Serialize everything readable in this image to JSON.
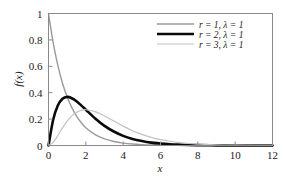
{
  "chart_data": {
    "type": "line",
    "title": "",
    "xlabel": "x",
    "ylabel": "f(x)",
    "xlim": [
      0,
      12
    ],
    "ylim": [
      0,
      1
    ],
    "grid": false,
    "legend_position": "upper-right-inset",
    "xticks": [
      "0",
      "2",
      "4",
      "6",
      "8",
      "10",
      "12"
    ],
    "xtick_values": [
      0,
      2,
      4,
      6,
      8,
      10,
      12
    ],
    "yticks": [
      "0",
      "0.2",
      "0.4",
      "0.6",
      "0.8",
      "1"
    ],
    "ytick_values": [
      0,
      0.2,
      0.4,
      0.6,
      0.8,
      1
    ],
    "series": [
      {
        "name": "r = 1, λ = 1",
        "color": "#9a9a9a",
        "width": 1.4,
        "x": [
          0,
          0.25,
          0.5,
          0.75,
          1,
          1.25,
          1.5,
          1.75,
          2,
          2.5,
          3,
          3.5,
          4,
          4.5,
          5,
          5.5,
          6,
          6.5,
          7,
          7.5,
          8,
          9,
          10,
          11,
          12
        ],
        "values": [
          1,
          0.779,
          0.607,
          0.472,
          0.368,
          0.287,
          0.223,
          0.174,
          0.135,
          0.082,
          0.05,
          0.03,
          0.018,
          0.011,
          0.0067,
          0.0041,
          0.0025,
          0.0015,
          0.0009,
          0.0006,
          0.0003,
          0.0001,
          5e-05,
          2e-05,
          6e-06
        ]
      },
      {
        "name": "r = 2, λ = 1",
        "color": "#0a0a0a",
        "width": 2.6,
        "x": [
          0,
          0.25,
          0.5,
          0.75,
          1,
          1.25,
          1.5,
          1.75,
          2,
          2.5,
          3,
          3.5,
          4,
          4.5,
          5,
          5.5,
          6,
          6.5,
          7,
          7.5,
          8,
          9,
          10,
          11,
          12
        ],
        "values": [
          0,
          0.195,
          0.303,
          0.354,
          0.368,
          0.358,
          0.335,
          0.304,
          0.271,
          0.205,
          0.149,
          0.106,
          0.073,
          0.05,
          0.034,
          0.022,
          0.015,
          0.0098,
          0.0064,
          0.0041,
          0.0027,
          0.0011,
          0.00045,
          0.00018,
          7e-05
        ]
      },
      {
        "name": "r = 3, λ = 1",
        "color": "#c2c2c2",
        "width": 1.2,
        "x": [
          0,
          0.25,
          0.5,
          0.75,
          1,
          1.25,
          1.5,
          1.75,
          2,
          2.5,
          3,
          3.5,
          4,
          4.5,
          5,
          5.5,
          6,
          6.5,
          7,
          7.5,
          8,
          9,
          10,
          11,
          12
        ],
        "values": [
          0,
          0.024,
          0.076,
          0.133,
          0.184,
          0.224,
          0.251,
          0.266,
          0.271,
          0.257,
          0.224,
          0.185,
          0.147,
          0.112,
          0.084,
          0.062,
          0.045,
          0.032,
          0.022,
          0.015,
          0.011,
          0.005,
          0.0023,
          0.001,
          0.00044
        ]
      }
    ]
  },
  "legend": {
    "entries": [
      {
        "label": "r = 1, λ = 1"
      },
      {
        "label": "r = 2, λ = 1"
      },
      {
        "label": "r = 3, λ = 1"
      }
    ]
  },
  "axes": {
    "x_title": "x",
    "y_title": "f(x)",
    "frame_color": "#8a8a8a"
  }
}
